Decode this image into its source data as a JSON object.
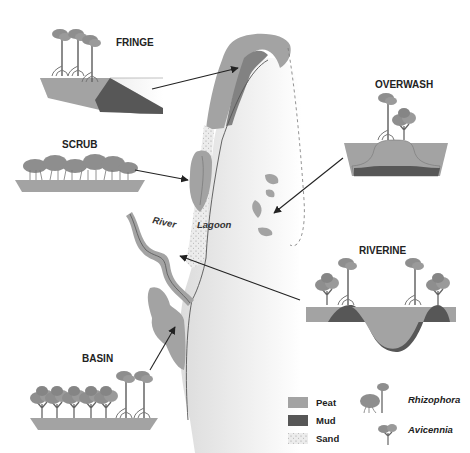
{
  "diagram": {
    "type": "mangrove-forest-types",
    "colors": {
      "peat": "#a3a3a3",
      "mud": "#575757",
      "sand": "#e2e2e2",
      "land_light": "#ececec",
      "water_dark": "#8a8a8a",
      "arrow": "#222222",
      "tree_canopy": "#8e8e8e"
    },
    "panels": [
      {
        "id": "fringe",
        "label": "FRINGE"
      },
      {
        "id": "scrub",
        "label": "SCRUB"
      },
      {
        "id": "overwash",
        "label": "OVERWASH"
      },
      {
        "id": "riverine",
        "label": "RIVERINE"
      },
      {
        "id": "basin",
        "label": "BASIN"
      }
    ],
    "map_labels": {
      "lagoon": "Lagoon",
      "river": "River"
    },
    "legend": {
      "substrates": [
        {
          "label": "Peat",
          "color": "#a3a3a3"
        },
        {
          "label": "Mud",
          "color": "#575757"
        },
        {
          "label": "Sand",
          "color": "#e2e2e2"
        }
      ],
      "species": [
        {
          "label": "Rhizophora",
          "icon": "rhizophora-tree-icon"
        },
        {
          "label": "Avicennia",
          "icon": "avicennia-tree-icon"
        }
      ]
    }
  }
}
